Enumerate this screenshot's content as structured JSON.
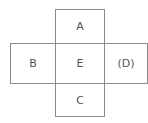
{
  "diagram": {
    "type": "cube-net",
    "cells": {
      "top": "A",
      "left": "B",
      "center": "E",
      "right": "(D)",
      "bottom": "C"
    },
    "line_color": "#8a8a8a",
    "text_color": "#555555"
  }
}
